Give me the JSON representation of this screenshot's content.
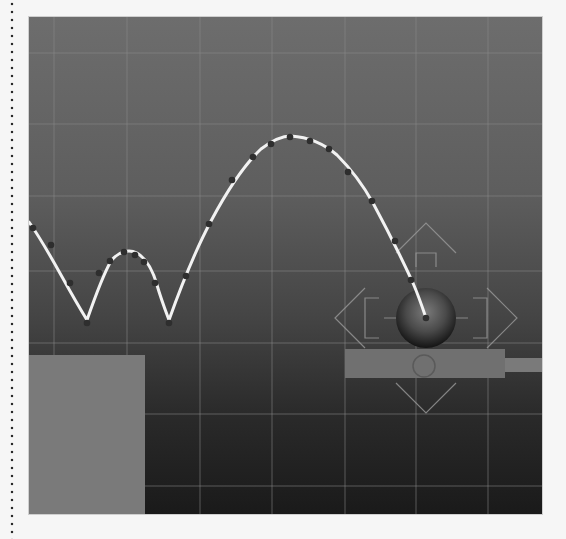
{
  "viewport": {
    "name": "3d-animation-viewport",
    "colors": {
      "background_top": "#6d6d6d",
      "background_bottom": "#1a1a1a",
      "grid_line": "#8a8a8a",
      "ground_block": "#7a7a7a",
      "platform": "#6f6f6f",
      "trajectory": "#f2f2f2",
      "keyframe_dot": "#2e2e2e",
      "manipulator": "#9a9a9a"
    },
    "grid": {
      "x_lines": [
        25,
        98,
        171,
        243,
        316,
        387,
        459
      ],
      "y_lines": [
        36,
        107,
        179,
        254,
        326,
        397,
        469
      ]
    }
  },
  "scene": {
    "ball": {
      "cx": 397,
      "cy": 301,
      "r": 30
    },
    "ground_block": {
      "x": 0,
      "y": 338,
      "w": 116,
      "h": 159
    },
    "platform": {
      "x": 316,
      "y": 332,
      "w": 160,
      "h": 29
    },
    "platform_stub": {
      "x": 476,
      "y": 341,
      "w": 37,
      "h": 14
    },
    "pivot_circle": {
      "cx": 395,
      "cy": 349,
      "r": 11
    },
    "trajectory_path": "M0,205 C12,222 22,240 32,258 C42,276 50,290 58,303 C68,270 80,240 95,235 C110,238 122,252 128,268 C134,282 137,295 140,303 C155,262 175,215 200,175 C225,140 245,120 262,119 C290,122 318,140 338,175 C358,210 375,250 397,301",
    "keyframes": [
      [
        4,
        211
      ],
      [
        20,
        228
      ],
      [
        42,
        266
      ],
      [
        58,
        303
      ],
      [
        70,
        255
      ],
      [
        82,
        242
      ],
      [
        95,
        235
      ],
      [
        106,
        237
      ],
      [
        116,
        245
      ],
      [
        128,
        268
      ],
      [
        140,
        303
      ],
      [
        157,
        257
      ],
      [
        180,
        207
      ],
      [
        203,
        163
      ],
      [
        221,
        142
      ],
      [
        241,
        125
      ],
      [
        261,
        119
      ],
      [
        281,
        124
      ],
      [
        300,
        131
      ],
      [
        320,
        155
      ],
      [
        344,
        184
      ],
      [
        367,
        224
      ],
      [
        384,
        264
      ],
      [
        397,
        301
      ]
    ]
  }
}
